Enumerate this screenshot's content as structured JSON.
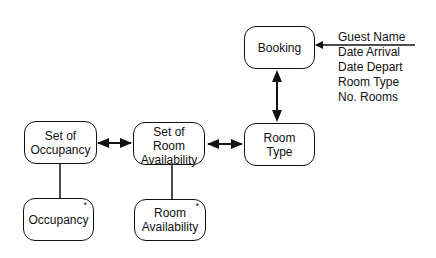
{
  "diagram": {
    "nodes": [
      {
        "id": "booking",
        "label": "Booking",
        "marker": ""
      },
      {
        "id": "room-type",
        "label": "Room\nType",
        "marker": ""
      },
      {
        "id": "set-of-room-availability",
        "label": "Set of\nRoom\nAvailability",
        "marker": ""
      },
      {
        "id": "set-of-occupancy",
        "label": "Set of\nOccupancy",
        "marker": ""
      },
      {
        "id": "occupancy",
        "label": "Occupancy",
        "marker": "*"
      },
      {
        "id": "room-availability",
        "label": "Room\nAvailability",
        "marker": "*"
      }
    ],
    "booking_inputs": [
      "Guest Name",
      "Date Arrival",
      "Date Depart",
      "Room Type",
      "No. Rooms"
    ],
    "edges": [
      {
        "from": "input",
        "to": "booking",
        "type": "single-arrow"
      },
      {
        "from": "booking",
        "to": "room-type",
        "type": "double-arrow"
      },
      {
        "from": "set-of-room-availability",
        "to": "room-type",
        "type": "double-arrow"
      },
      {
        "from": "set-of-occupancy",
        "to": "set-of-room-availability",
        "type": "double-arrow"
      },
      {
        "from": "set-of-occupancy",
        "to": "occupancy",
        "type": "line"
      },
      {
        "from": "set-of-room-availability",
        "to": "room-availability",
        "type": "line"
      }
    ]
  }
}
